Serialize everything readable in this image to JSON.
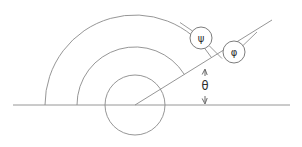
{
  "figure": {
    "kind": "geometry-angle-diagram",
    "canvas": {
      "width": 302,
      "height": 147,
      "background": "#ffffff"
    },
    "palette": {
      "line": "#8a8a8a",
      "dimension_arrow": "#5a5a5a",
      "badge_ring": "#6d6d6d",
      "badge_fill": "#ffffff",
      "glyph": "#2c2c2c"
    },
    "geometry": {
      "origin": {
        "x": 135,
        "y": 105
      },
      "baseline": {
        "x1": 13,
        "y1": 105,
        "x2": 290,
        "y2": 105
      },
      "ray": {
        "x1": 135,
        "y1": 105,
        "x2": 272,
        "y2": 20,
        "angle_deg": 31.8
      },
      "inner_circle_radius": 30,
      "arc_radii": [
        58,
        90
      ],
      "arc_start_deg": 180,
      "arc_end_deg": 31.8,
      "arc_baseline_intersections_x": [
        77,
        45
      ]
    },
    "labels": {
      "theta": "θ",
      "psi": "ψ",
      "phi": "φ"
    },
    "label_positions": {
      "theta": {
        "x": 205,
        "y": 86
      },
      "psi_badge": {
        "x": 201,
        "y": 38,
        "r": 11
      },
      "phi_badge": {
        "x": 234,
        "y": 52,
        "r": 11
      }
    },
    "dimension": {
      "theta_arrow": {
        "x": 205,
        "y_top": 70,
        "y_bottom": 103,
        "double_headed": true
      }
    },
    "leaders": {
      "psi_to_ray": {
        "x1": 209,
        "y1": 46,
        "x2": 222,
        "y2": 58
      },
      "psi_to_outer_arc": {
        "x1": 193,
        "y1": 31,
        "x2": 180,
        "y2": 22
      },
      "phi_to_ray": {
        "x1": 243,
        "y1": 46,
        "x2": 256,
        "y2": 33
      }
    }
  }
}
